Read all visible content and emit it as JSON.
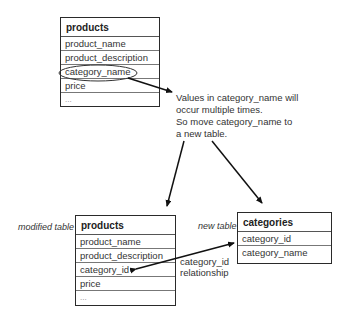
{
  "original_table": {
    "name": "products",
    "columns": [
      "product_name",
      "product_description",
      "category_name",
      "price",
      "..."
    ],
    "highlighted_column": "category_name"
  },
  "note": {
    "lines": [
      "Values in category_name will",
      "occur multiple times.",
      "So move category_name to",
      "a new table."
    ]
  },
  "modified_table": {
    "label": "modified table",
    "name": "products",
    "columns": [
      "product_name",
      "product_description",
      "category_id",
      "price",
      "..."
    ]
  },
  "new_table": {
    "label": "new table",
    "name": "categories",
    "columns": [
      "category_id",
      "category_name"
    ]
  },
  "relationship": {
    "lines": [
      "category_id",
      "relationship"
    ]
  }
}
